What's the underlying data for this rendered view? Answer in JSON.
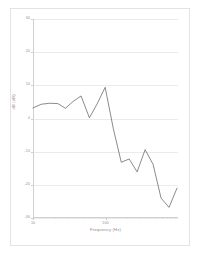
{
  "figure": {
    "background_color": "#ffffff",
    "frame_color": "#e3e3e3",
    "line_color": "#595959",
    "grid_color": "#ebebeb",
    "tick_text_color": "#8c8c8c"
  },
  "chart_data": {
    "type": "line",
    "title": "",
    "subtitle": "",
    "xlabel": "Frequency (Hz)",
    "ylabel": "dB (dB)",
    "xscale": "log",
    "yscale": "linear",
    "xlim": [
      10,
      1000
    ],
    "ylim": [
      -30,
      30
    ],
    "grid": true,
    "grid_axis": "y",
    "legend": false,
    "legend_position": "none",
    "ytick_labels": [
      "30",
      "20",
      "10",
      "0",
      "-10",
      "-20",
      "-30"
    ],
    "ytick_values": [
      30,
      20,
      10,
      0,
      -10,
      -20,
      -30
    ],
    "xtick_labels": [
      "10",
      "100"
    ],
    "xtick_values": [
      10,
      100
    ],
    "xminor_ticks": [
      20,
      30,
      40,
      50,
      60,
      70,
      80,
      90,
      200,
      300,
      400,
      500,
      600,
      700,
      800,
      900
    ],
    "series": [
      {
        "name": "Response",
        "color": "#595959",
        "x": [
          10,
          13,
          17,
          22,
          28,
          36,
          46,
          60,
          77,
          99,
          128,
          165,
          212,
          273,
          352,
          453,
          584,
          752,
          969
        ],
        "y": [
          3.2,
          4.3,
          4.6,
          4.5,
          3.1,
          5.2,
          6.8,
          0.2,
          4.5,
          9.4,
          -3.0,
          -13.2,
          -12.2,
          -16.1,
          -9.4,
          -13.8,
          -24.0,
          -26.8,
          -21.0
        ]
      }
    ]
  }
}
